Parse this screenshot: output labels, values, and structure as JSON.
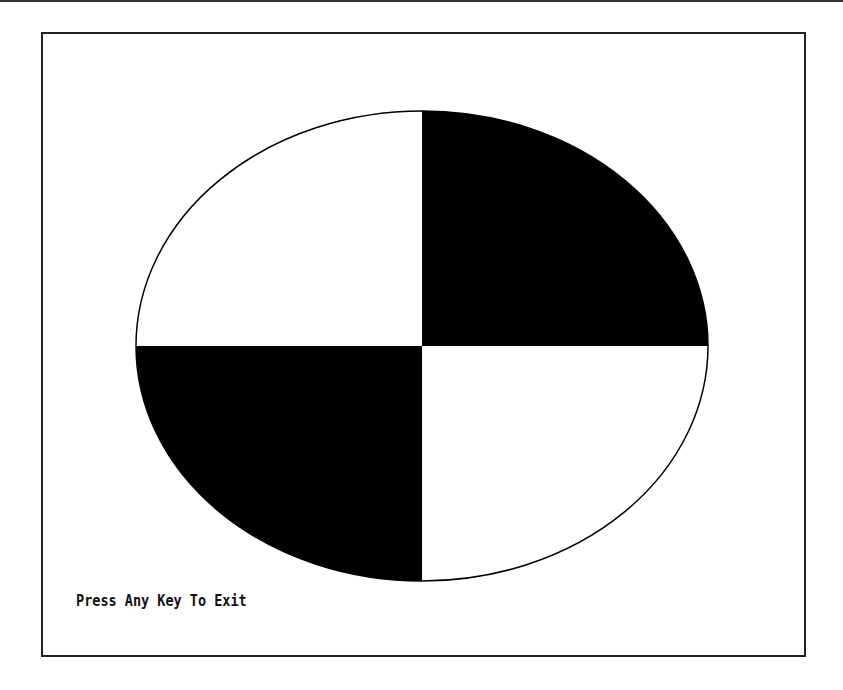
{
  "screen": {
    "prompt_text": "Press Any Key To Exit",
    "colors": {
      "background": "#ffffff",
      "fill": "#000000",
      "outline": "#000000"
    }
  },
  "ellipse": {
    "cx": 422,
    "cy": 346,
    "rx": 286,
    "ry": 235,
    "filled_quadrants": [
      "top-right",
      "bottom-left"
    ],
    "empty_quadrants": [
      "top-left",
      "bottom-right"
    ]
  }
}
